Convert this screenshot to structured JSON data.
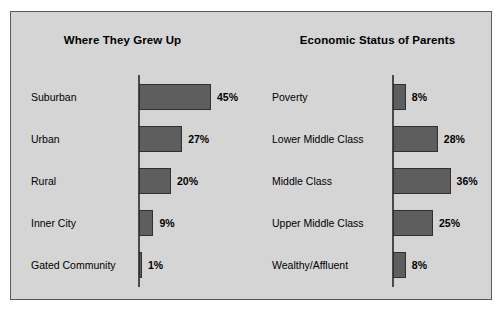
{
  "figure": {
    "background_color": "#d5d5d5",
    "border_color": "#5a5a5a",
    "bar_fill_color": "#5e5e5e",
    "bar_border_color": "#2f2f2f",
    "axis_color": "#4a4a4a"
  },
  "chart_data": [
    {
      "type": "bar",
      "orientation": "horizontal",
      "title": "Where They Grew Up",
      "xlabel": "",
      "ylabel": "",
      "xlim": [
        0,
        50
      ],
      "grid": false,
      "legend": false,
      "categories": [
        "Suburban",
        "Urban",
        "Rural",
        "Inner City",
        "Gated Community"
      ],
      "values": [
        45,
        27,
        20,
        9,
        1
      ],
      "value_labels": [
        "45%",
        "27%",
        "20%",
        "9%",
        "1%"
      ]
    },
    {
      "type": "bar",
      "orientation": "horizontal",
      "title": "Economic Status of Parents",
      "xlabel": "",
      "ylabel": "",
      "xlim": [
        0,
        50
      ],
      "grid": false,
      "legend": false,
      "categories": [
        "Poverty",
        "Lower Middle Class",
        "Middle Class",
        "Upper Middle Class",
        "Wealthy/Affluent"
      ],
      "values": [
        8,
        28,
        36,
        25,
        8
      ],
      "value_labels": [
        "8%",
        "28%",
        "36%",
        "25%",
        "8%"
      ]
    }
  ]
}
